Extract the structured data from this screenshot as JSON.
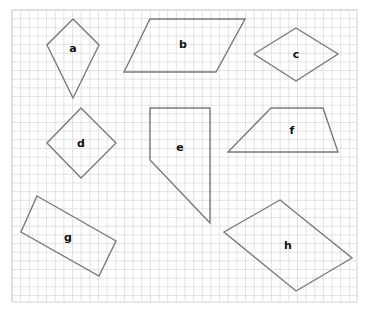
{
  "grid": {
    "x": 12,
    "y": 10,
    "width": 345,
    "height": 292,
    "cell": 8.65,
    "line_color": "#dcdcdc",
    "border_color": "#d0d0d0"
  },
  "colors": {
    "stroke": "#7a7a7a",
    "label": "#111111",
    "background": "#ffffff"
  },
  "shapes": [
    {
      "id": "a",
      "label": "a",
      "type": "kite",
      "points": "73,19 99,45 73,98 47,45",
      "label_pos": [
        73,
        49
      ]
    },
    {
      "id": "b",
      "label": "b",
      "type": "parallelogram",
      "points": "150,19 245,19 216,72 124,72",
      "label_pos": [
        183,
        45
      ]
    },
    {
      "id": "c",
      "label": "c",
      "type": "rhombus",
      "points": "254,54 296,28 338,54 296,81",
      "label_pos": [
        296,
        55
      ]
    },
    {
      "id": "d",
      "label": "d",
      "type": "square",
      "points": "81,108 116,143 81,178 47,143",
      "label_pos": [
        81,
        144
      ]
    },
    {
      "id": "e",
      "label": "e",
      "type": "irregular-quadrilateral",
      "points": "150,108 210,108 210,223 150,160",
      "label_pos": [
        180,
        148
      ]
    },
    {
      "id": "f",
      "label": "f",
      "type": "trapezoid",
      "points": "271,108 323,108 338,152 228,152",
      "label_pos": [
        292,
        131
      ]
    },
    {
      "id": "g",
      "label": "g",
      "type": "rectangle",
      "points": "37,196 116,241 99,276 21,232",
      "label_pos": [
        68,
        238
      ]
    },
    {
      "id": "h",
      "label": "h",
      "type": "parallelogram",
      "points": "280,200 352,258 296,291 224,232",
      "label_pos": [
        288,
        246
      ]
    }
  ]
}
